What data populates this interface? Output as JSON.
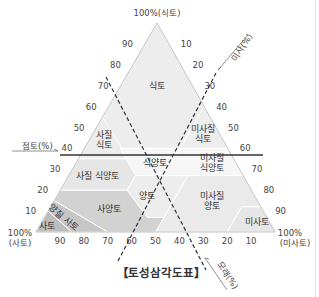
{
  "title": "【토성삼각도표】",
  "corners": {
    "top": "100%(식토)",
    "left_line1": "100%",
    "left_line2": "(사토)",
    "right_line1": "100%",
    "right_line2": "(미사토)"
  },
  "axis_labels": {
    "clay": "점토(%)",
    "silt": "미사(%)",
    "sand": "모래(%)"
  },
  "ticks": {
    "left_edge": [
      "90",
      "80",
      "70",
      "60",
      "50",
      "40",
      "30",
      "20",
      "10"
    ],
    "right_edge": [
      "10",
      "20",
      "30",
      "40",
      "50",
      "60",
      "70",
      "80",
      "90"
    ],
    "bottom_edge": [
      "90",
      "80",
      "70",
      "60",
      "50",
      "40",
      "30",
      "20",
      "10"
    ]
  },
  "regions": [
    {
      "name": "clay",
      "label": "식토",
      "lines": [
        "식토"
      ],
      "fill": "#ededed",
      "pts": [
        [
          100,
          0
        ],
        [
          60,
          40
        ],
        [
          40,
          40
        ],
        [
          40,
          15
        ],
        [
          55,
          0
        ]
      ],
      "label_at": [
        70,
        15
      ]
    },
    {
      "name": "sandy-clay",
      "label": "사질 식토",
      "lines": [
        "사질",
        "식토"
      ],
      "fill": "#ededed",
      "pts": [
        [
          55,
          0
        ],
        [
          35,
          0
        ],
        [
          35,
          20
        ],
        [
          36,
          20
        ]
      ],
      "label_at": [
        44,
        6
      ]
    },
    {
      "name": "silty-clay",
      "label": "미사질 식토",
      "lines": [
        "미사질",
        "식토"
      ],
      "fill": "#ededed",
      "pts": [
        [
          60,
          40
        ],
        [
          40,
          60
        ],
        [
          40,
          40
        ]
      ],
      "label_at": [
        47,
        46
      ]
    },
    {
      "name": "clay-loam",
      "label": "식양토",
      "lines": [
        "식양토"
      ],
      "fill": "#f6f6f6",
      "pts": [
        [
          40,
          15
        ],
        [
          40,
          40
        ],
        [
          27,
          40
        ],
        [
          27,
          28
        ]
      ],
      "label_at": [
        33,
        33
      ]
    },
    {
      "name": "silty-clay-loam",
      "label": "미사질 식양토",
      "lines": [
        "미사질",
        "식양토"
      ],
      "fill": "#f6f6f6",
      "pts": [
        [
          40,
          40
        ],
        [
          40,
          60
        ],
        [
          27,
          73
        ],
        [
          27,
          40
        ]
      ],
      "label_at": [
        33,
        57
      ]
    },
    {
      "name": "sandy-clay-loam",
      "label": "사질 식양토",
      "lines": [
        "사질 식양토"
      ],
      "fill": "#e6e6e6",
      "pts": [
        [
          35,
          0
        ],
        [
          20,
          0
        ],
        [
          20,
          28
        ],
        [
          27,
          28
        ],
        [
          35,
          20
        ]
      ],
      "label_at": [
        27,
        12
      ]
    },
    {
      "name": "loam",
      "label": "양토",
      "lines": [
        "양토"
      ],
      "fill": "#ededed",
      "pts": [
        [
          27,
          28
        ],
        [
          27,
          50
        ],
        [
          7,
          50
        ],
        [
          7,
          43
        ],
        [
          20,
          28
        ]
      ],
      "label_at": [
        17,
        38
      ]
    },
    {
      "name": "silt-loam",
      "label": "미사질 양토",
      "lines": [
        "미사질",
        "양토"
      ],
      "fill": "#eaeaea",
      "pts": [
        [
          27,
          50
        ],
        [
          27,
          73
        ],
        [
          12,
          88
        ],
        [
          12,
          80
        ],
        [
          0,
          80
        ],
        [
          0,
          50
        ],
        [
          7,
          50
        ]
      ],
      "label_at": [
        15,
        66
      ]
    },
    {
      "name": "silt",
      "label": "미사토",
      "lines": [
        "미사토"
      ],
      "fill": "#e6e6e6",
      "pts": [
        [
          12,
          80
        ],
        [
          12,
          88
        ],
        [
          0,
          100
        ],
        [
          0,
          80
        ]
      ],
      "label_at": [
        5,
        90
      ]
    },
    {
      "name": "sandy-loam",
      "label": "사양토",
      "lines": [
        "사양토"
      ],
      "fill": "#d2d2d2",
      "pts": [
        [
          20,
          0
        ],
        [
          20,
          28
        ],
        [
          7,
          43
        ],
        [
          7,
          50
        ],
        [
          0,
          50
        ],
        [
          0,
          30
        ],
        [
          15,
          0
        ]
      ],
      "label_at": [
        11,
        25
      ]
    },
    {
      "name": "loamy-sand",
      "label": "양질 사토",
      "lines": [
        "양질 사토"
      ],
      "fill": "#c6c6c6",
      "pts": [
        [
          15,
          0
        ],
        [
          0,
          30
        ],
        [
          0,
          15
        ],
        [
          10,
          0
        ]
      ],
      "label_at": [
        7,
        8
      ]
    },
    {
      "name": "sand",
      "label": "사토",
      "lines": [
        "사토"
      ],
      "fill": "#bdbdbd",
      "pts": [
        [
          10,
          0
        ],
        [
          0,
          15
        ],
        [
          0,
          0
        ]
      ],
      "label_at": [
        3,
        3
      ]
    }
  ],
  "triangle": {
    "apex": [
      157,
      23
    ],
    "left": [
      36,
      232
    ],
    "right": [
      275,
      232
    ]
  },
  "colors": {
    "edge": "#b5b5b5",
    "region_border": "#ffffff",
    "guide": "#333333"
  }
}
